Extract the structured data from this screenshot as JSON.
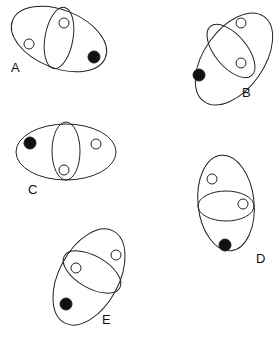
{
  "colors": {
    "stroke": "#222222",
    "filled": "#111111",
    "open": "#ffffff"
  },
  "figures": [
    {
      "label": "A",
      "label_pos": [
        11,
        72
      ],
      "outer": {
        "cx": 59,
        "cy": 39,
        "rx": 50,
        "ry": 29,
        "rot": 22
      },
      "inner": {
        "cx": 59,
        "cy": 38,
        "rx": 14,
        "ry": 31,
        "rot": 10
      },
      "dots": [
        {
          "cx": 29,
          "cy": 44,
          "r": 5,
          "filled": false
        },
        {
          "cx": 64,
          "cy": 23,
          "r": 5,
          "filled": false
        },
        {
          "cx": 94,
          "cy": 57,
          "r": 6,
          "filled": true
        }
      ]
    },
    {
      "label": "B",
      "label_pos": [
        242,
        97
      ],
      "outer": {
        "cx": 234,
        "cy": 59,
        "rx": 52,
        "ry": 30,
        "rot": -55
      },
      "inner": {
        "cx": 231,
        "cy": 51,
        "rx": 32,
        "ry": 16,
        "rot": 50
      },
      "dots": [
        {
          "cx": 241,
          "cy": 23,
          "r": 5,
          "filled": false
        },
        {
          "cx": 241,
          "cy": 63,
          "r": 5,
          "filled": false
        },
        {
          "cx": 199,
          "cy": 75,
          "r": 6,
          "filled": true
        }
      ]
    },
    {
      "label": "C",
      "label_pos": [
        28,
        194
      ],
      "outer": {
        "cx": 66,
        "cy": 152,
        "rx": 50,
        "ry": 28,
        "rot": 0
      },
      "inner": {
        "cx": 66,
        "cy": 151,
        "rx": 14,
        "ry": 29,
        "rot": 0
      },
      "dots": [
        {
          "cx": 30,
          "cy": 143,
          "r": 6,
          "filled": true
        },
        {
          "cx": 96,
          "cy": 144,
          "r": 5,
          "filled": false
        },
        {
          "cx": 64,
          "cy": 170,
          "r": 5,
          "filled": false
        }
      ]
    },
    {
      "label": "D",
      "label_pos": [
        256,
        263
      ],
      "outer": {
        "cx": 226,
        "cy": 203,
        "rx": 28,
        "ry": 48,
        "rot": -6
      },
      "inner": {
        "cx": 226,
        "cy": 206,
        "rx": 28,
        "ry": 15,
        "rot": 0
      },
      "dots": [
        {
          "cx": 212,
          "cy": 179,
          "r": 5,
          "filled": false
        },
        {
          "cx": 243,
          "cy": 204,
          "r": 5,
          "filled": false
        },
        {
          "cx": 225,
          "cy": 245,
          "r": 6,
          "filled": true
        }
      ]
    },
    {
      "label": "E",
      "label_pos": [
        102,
        324
      ],
      "outer": {
        "cx": 89,
        "cy": 277,
        "rx": 52,
        "ry": 30,
        "rot": -62
      },
      "inner": {
        "cx": 92,
        "cy": 272,
        "rx": 32,
        "ry": 16,
        "rot": 30
      },
      "dots": [
        {
          "cx": 116,
          "cy": 255,
          "r": 5,
          "filled": false
        },
        {
          "cx": 76,
          "cy": 268,
          "r": 5,
          "filled": false
        },
        {
          "cx": 66,
          "cy": 304,
          "r": 6,
          "filled": true
        }
      ]
    }
  ]
}
